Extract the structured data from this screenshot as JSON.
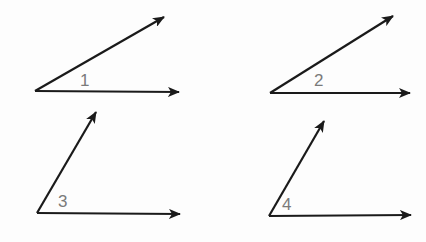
{
  "diagram": {
    "line_color": "#1a1a1a",
    "label_color": "#7a7a7a",
    "angles": [
      {
        "label": "1",
        "vertex": [
          35,
          91
        ],
        "ray_a": [
          164,
          17
        ],
        "ray_b": [
          179,
          92
        ],
        "label_pos": [
          80,
          72
        ]
      },
      {
        "label": "2",
        "vertex": [
          270,
          93
        ],
        "ray_a": [
          393,
          16
        ],
        "ray_b": [
          410,
          93
        ],
        "label_pos": [
          314,
          72
        ]
      },
      {
        "label": "3",
        "vertex": [
          37,
          213
        ],
        "ray_a": [
          96,
          112
        ],
        "ray_b": [
          180,
          214
        ],
        "label_pos": [
          58,
          193
        ]
      },
      {
        "label": "4",
        "vertex": [
          269,
          216
        ],
        "ray_a": [
          324,
          121
        ],
        "ray_b": [
          411,
          215
        ],
        "label_pos": [
          282,
          196
        ]
      }
    ]
  }
}
